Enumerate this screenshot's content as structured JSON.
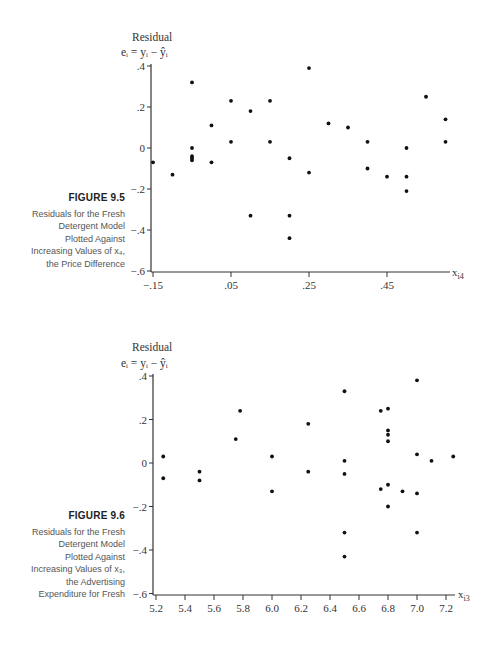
{
  "figures": [
    {
      "number": "FIGURE 9.5",
      "caption_lines": [
        "Residuals for the Fresh",
        "Detergent Model",
        "Plotted Against",
        "Increasing Values of x₄,",
        "the Price Difference"
      ],
      "y_title": "Residual",
      "y_formula": "eᵢ = yᵢ − ŷᵢ",
      "x_label": "x",
      "x_label_sub": "i4"
    },
    {
      "number": "FIGURE 9.6",
      "caption_lines": [
        "Residuals for the Fresh",
        "Detergent Model",
        "Plotted Against",
        "Increasing Values of x₃,",
        "the Advertising",
        "Expenditure for Fresh"
      ],
      "y_title": "Residual",
      "y_formula": "eᵢ = yᵢ − ŷᵢ",
      "x_label": "x",
      "x_label_sub": "i3"
    }
  ],
  "chart_data": [
    {
      "type": "scatter",
      "title": "FIGURE 9.5 Residuals for the Fresh Detergent Model Plotted Against Increasing Values of x4, the Price Difference",
      "xlabel": "x_i4",
      "ylabel": "Residual e_i = y_i - ŷ_i",
      "xticks": [
        -0.15,
        0.05,
        0.25,
        0.45
      ],
      "xtick_labels": [
        "−.15",
        ".05",
        ".25",
        ".45"
      ],
      "yticks": [
        0.4,
        0.2,
        0,
        -0.2,
        -0.4,
        -0.6
      ],
      "ytick_labels": [
        ".4",
        ".2",
        "0",
        "−.2",
        "−.4",
        "−.6"
      ],
      "xlim": [
        -0.15,
        0.67
      ],
      "ylim": [
        -0.6,
        0.42
      ],
      "grid": false,
      "points": [
        {
          "x": -0.15,
          "y": -0.07
        },
        {
          "x": -0.1,
          "y": -0.13
        },
        {
          "x": -0.05,
          "y": 0.32
        },
        {
          "x": -0.05,
          "y": 0.0
        },
        {
          "x": -0.05,
          "y": -0.04
        },
        {
          "x": -0.05,
          "y": -0.05
        },
        {
          "x": -0.05,
          "y": -0.06
        },
        {
          "x": 0.0,
          "y": 0.11
        },
        {
          "x": 0.0,
          "y": -0.07
        },
        {
          "x": 0.05,
          "y": 0.23
        },
        {
          "x": 0.05,
          "y": 0.03
        },
        {
          "x": 0.1,
          "y": 0.18
        },
        {
          "x": 0.1,
          "y": -0.33
        },
        {
          "x": 0.15,
          "y": 0.23
        },
        {
          "x": 0.15,
          "y": 0.03
        },
        {
          "x": 0.2,
          "y": -0.05
        },
        {
          "x": 0.2,
          "y": -0.33
        },
        {
          "x": 0.2,
          "y": -0.44
        },
        {
          "x": 0.25,
          "y": 0.39
        },
        {
          "x": 0.25,
          "y": -0.12
        },
        {
          "x": 0.3,
          "y": 0.12
        },
        {
          "x": 0.35,
          "y": 0.1
        },
        {
          "x": 0.4,
          "y": 0.03
        },
        {
          "x": 0.4,
          "y": -0.1
        },
        {
          "x": 0.45,
          "y": -0.14
        },
        {
          "x": 0.5,
          "y": 0.0
        },
        {
          "x": 0.5,
          "y": -0.14
        },
        {
          "x": 0.5,
          "y": -0.21
        },
        {
          "x": 0.55,
          "y": 0.25
        },
        {
          "x": 0.6,
          "y": 0.14
        },
        {
          "x": 0.6,
          "y": 0.03
        }
      ]
    },
    {
      "type": "scatter",
      "title": "FIGURE 9.6 Residuals for the Fresh Detergent Model Plotted Against Increasing Values of x3, the Advertising Expenditure for Fresh",
      "xlabel": "x_i3",
      "ylabel": "Residual e_i = y_i - ŷ_i",
      "xticks": [
        5.2,
        5.4,
        5.6,
        5.8,
        6.0,
        6.2,
        6.4,
        6.6,
        6.8,
        7.0,
        7.2
      ],
      "xtick_labels": [
        "5.2",
        "5.4",
        "5.6",
        "5.8",
        "6.0",
        "6.2",
        "6.4",
        "6.6",
        "6.8",
        "7.0",
        "7.2"
      ],
      "yticks": [
        0.4,
        0.2,
        0,
        -0.2,
        -0.4,
        -0.6
      ],
      "ytick_labels": [
        ".4",
        ".2",
        "0",
        "−.2",
        "−.4",
        "−.6"
      ],
      "xlim": [
        5.2,
        7.27
      ],
      "ylim": [
        -0.6,
        0.42
      ],
      "grid": false,
      "points": [
        {
          "x": 5.25,
          "y": 0.03
        },
        {
          "x": 5.25,
          "y": -0.07
        },
        {
          "x": 5.5,
          "y": -0.04
        },
        {
          "x": 5.5,
          "y": -0.08
        },
        {
          "x": 5.75,
          "y": 0.11
        },
        {
          "x": 5.78,
          "y": 0.24
        },
        {
          "x": 6.0,
          "y": 0.03
        },
        {
          "x": 6.0,
          "y": -0.13
        },
        {
          "x": 6.25,
          "y": 0.18
        },
        {
          "x": 6.25,
          "y": -0.04
        },
        {
          "x": 6.5,
          "y": 0.33
        },
        {
          "x": 6.5,
          "y": 0.01
        },
        {
          "x": 6.5,
          "y": -0.05
        },
        {
          "x": 6.5,
          "y": -0.32
        },
        {
          "x": 6.5,
          "y": -0.43
        },
        {
          "x": 6.75,
          "y": 0.24
        },
        {
          "x": 6.75,
          "y": -0.12
        },
        {
          "x": 6.8,
          "y": 0.25
        },
        {
          "x": 6.8,
          "y": 0.15
        },
        {
          "x": 6.8,
          "y": 0.13
        },
        {
          "x": 6.8,
          "y": 0.1
        },
        {
          "x": 6.8,
          "y": -0.1
        },
        {
          "x": 6.8,
          "y": -0.2
        },
        {
          "x": 6.9,
          "y": -0.13
        },
        {
          "x": 7.0,
          "y": 0.38
        },
        {
          "x": 7.0,
          "y": 0.04
        },
        {
          "x": 7.0,
          "y": -0.14
        },
        {
          "x": 7.0,
          "y": -0.32
        },
        {
          "x": 7.1,
          "y": 0.01
        },
        {
          "x": 7.25,
          "y": 0.03
        }
      ]
    }
  ]
}
